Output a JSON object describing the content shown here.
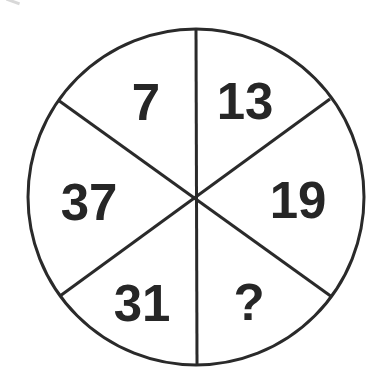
{
  "puzzle": {
    "type": "number-wheel",
    "sectors": [
      {
        "position": "top-left",
        "value": "7"
      },
      {
        "position": "top-right",
        "value": "13"
      },
      {
        "position": "right",
        "value": "19"
      },
      {
        "position": "bottom-right",
        "value": "?"
      },
      {
        "position": "bottom-left",
        "value": "31"
      },
      {
        "position": "left",
        "value": "37"
      }
    ],
    "colors": {
      "line": "#2a2a2a",
      "text": "#262626",
      "background": "#ffffff"
    }
  }
}
